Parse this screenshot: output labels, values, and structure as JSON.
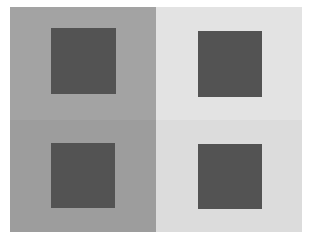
{
  "figure": {
    "panels": [
      {
        "id": "top-left",
        "bg": "#a3a3a3",
        "square": "#535353"
      },
      {
        "id": "top-right",
        "bg": "#e3e3e3",
        "square": "#535353"
      },
      {
        "id": "bottom-left",
        "bg": "#9d9d9d",
        "square": "#535353"
      },
      {
        "id": "bottom-right",
        "bg": "#dcdcdc",
        "square": "#535353"
      }
    ]
  }
}
